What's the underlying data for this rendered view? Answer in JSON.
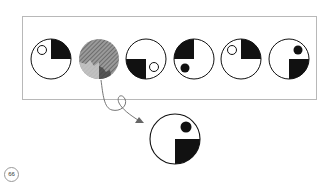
{
  "puzzle": {
    "sequence_count": 6,
    "missing_index": 2,
    "answer_label": "answer-figure",
    "colors": {
      "ink": "#111111",
      "frame": "#b8b8b8",
      "hatch": "#7a7a7a",
      "arrow": "#666666"
    }
  },
  "page": {
    "number": "66"
  }
}
